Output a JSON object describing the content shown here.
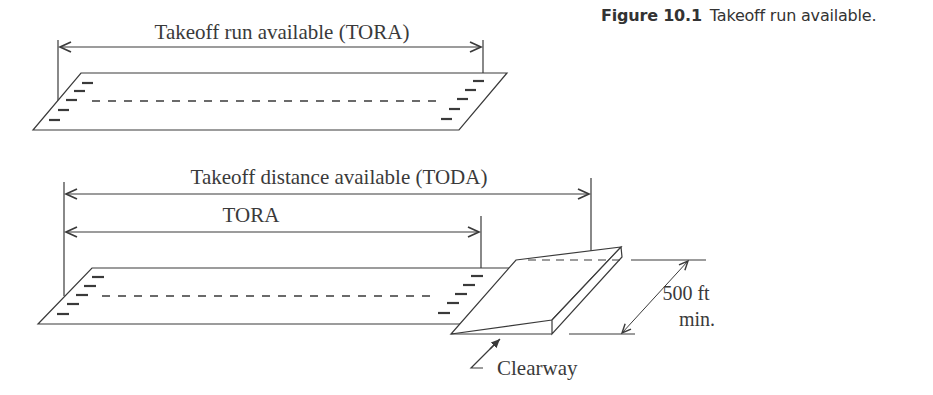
{
  "caption": {
    "figure_number": "Figure 10.1",
    "text": "Takeoff run available."
  },
  "top_diagram": {
    "dimension_label": "Takeoff run available (TORA)"
  },
  "bottom_diagram": {
    "toda_label": "Takeoff distance available (TODA)",
    "tora_label": "TORA",
    "width_label_line1": "500 ft",
    "width_label_line2": "min.",
    "clearway_label": "Clearway"
  },
  "colors": {
    "line": "#3a3a3a",
    "background": "#ffffff"
  }
}
